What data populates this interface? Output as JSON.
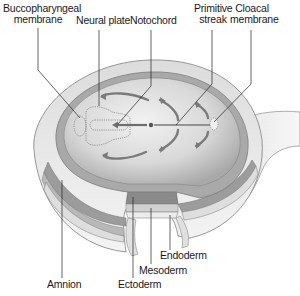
{
  "diagram": {
    "labels": {
      "buccopharyngeal_membrane": {
        "line1": "Buccopharyngeal",
        "line2": "membrane"
      },
      "neural_plate": "Neural plate",
      "notochord": "Notochord",
      "primitive_streak": {
        "line1": "Primitive",
        "line2": "streak"
      },
      "cloacal_membrane": {
        "line1": "Cloacal",
        "line2": "membrane"
      },
      "endoderm": "Endoderm",
      "mesoderm": "Mesoderm",
      "ectoderm": "Ectoderm",
      "amnion": "Amnion"
    },
    "colors": {
      "disc_surface": "#d4d4d4",
      "disc_highlight": "#ececec",
      "layer_dark": "#8a8a8a",
      "layer_mid": "#b5b5b5",
      "layer_light": "#e2e2e2",
      "arrows": "#7a7a7a",
      "leader_lines": "#222222"
    }
  }
}
